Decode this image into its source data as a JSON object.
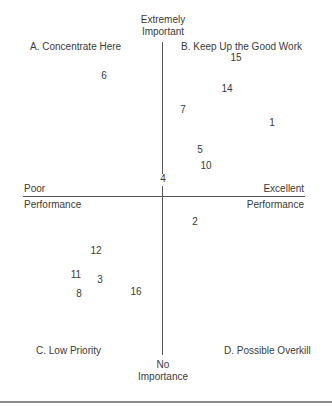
{
  "chart_data": {
    "type": "scatter",
    "y_axis": {
      "top_label": "Extremely Important",
      "bottom_label": "No Importance"
    },
    "x_axis": {
      "left_label_top": "Poor",
      "left_label_bottom": "Performance",
      "right_label_top": "Excellent",
      "right_label_bottom": "Performance"
    },
    "quadrants": {
      "A": "A. Concentrate Here",
      "B": "B. Keep Up the Good Work",
      "C": "C. Low Priority",
      "D": "D. Possible Overkill"
    },
    "points": [
      {
        "label": "15",
        "x": 236,
        "y": 58
      },
      {
        "label": "6",
        "x": 104,
        "y": 76
      },
      {
        "label": "14",
        "x": 227,
        "y": 89
      },
      {
        "label": "7",
        "x": 183,
        "y": 110
      },
      {
        "label": "1",
        "x": 272,
        "y": 123
      },
      {
        "label": "5",
        "x": 200,
        "y": 150
      },
      {
        "label": "10",
        "x": 206,
        "y": 166
      },
      {
        "label": "4",
        "x": 163,
        "y": 179
      },
      {
        "label": "2",
        "x": 195,
        "y": 222
      },
      {
        "label": "12",
        "x": 96,
        "y": 251
      },
      {
        "label": "11",
        "x": 76,
        "y": 275
      },
      {
        "label": "3",
        "x": 100,
        "y": 280
      },
      {
        "label": "8",
        "x": 79,
        "y": 294
      },
      {
        "label": "16",
        "x": 136,
        "y": 292
      }
    ],
    "grid": false,
    "legend": "none"
  }
}
